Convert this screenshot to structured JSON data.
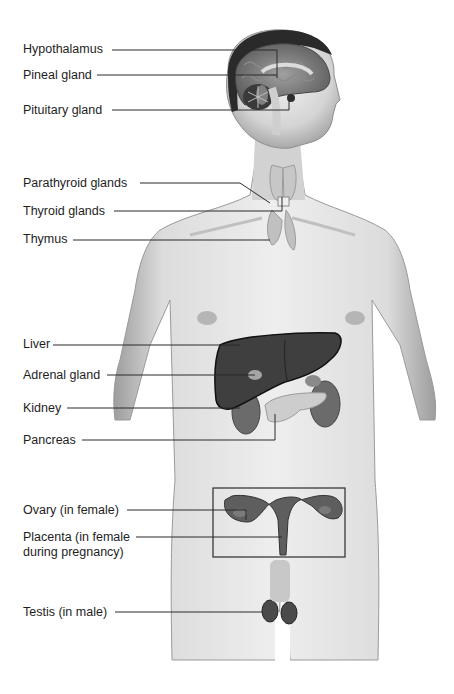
{
  "diagram": {
    "labels": [
      {
        "id": "hypothalamus",
        "text": "Hypothalamus"
      },
      {
        "id": "pineal",
        "text": "Pineal gland"
      },
      {
        "id": "pituitary",
        "text": "Pituitary gland"
      },
      {
        "id": "parathyroid",
        "text": "Parathyroid glands"
      },
      {
        "id": "thyroid",
        "text": "Thyroid glands"
      },
      {
        "id": "thymus",
        "text": "Thymus"
      },
      {
        "id": "liver",
        "text": "Liver"
      },
      {
        "id": "adrenal",
        "text": "Adrenal gland"
      },
      {
        "id": "kidney",
        "text": "Kidney"
      },
      {
        "id": "pancreas",
        "text": "Pancreas"
      },
      {
        "id": "ovary",
        "text": "Ovary (in female)"
      },
      {
        "id": "placenta",
        "text": "Placenta (in female during pregnancy)"
      },
      {
        "id": "testis",
        "text": "Testis (in male)"
      }
    ],
    "colors": {
      "background": "#ffffff",
      "skin": "#d9d9d9",
      "skin_shadow": "#a8a8a8",
      "hair": "#2a2a2a",
      "organ_dark": "#3c3c3c",
      "organ_mid": "#6e6e6e",
      "gland_light": "#bdbdbd",
      "leader_line": "#2b2b2b"
    }
  }
}
